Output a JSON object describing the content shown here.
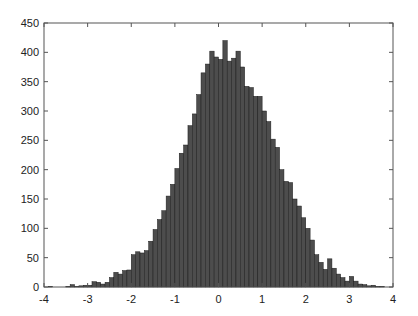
{
  "chart_data": {
    "type": "bar",
    "title": "",
    "xlabel": "",
    "ylabel": "",
    "xlim": [
      -4,
      4
    ],
    "ylim": [
      0,
      450
    ],
    "grid": false,
    "legend": null,
    "bin_width": 0.1,
    "bin_start": -4.0,
    "x_ticks": [
      -4,
      -3,
      -2,
      -1,
      0,
      1,
      2,
      3,
      4
    ],
    "y_ticks": [
      0,
      50,
      100,
      150,
      200,
      250,
      300,
      350,
      400,
      450
    ],
    "x_tick_labels": [
      "-4",
      "-3",
      "-2",
      "-1",
      "0",
      "1",
      "2",
      "3",
      "4"
    ],
    "y_tick_labels": [
      "0",
      "50",
      "100",
      "150",
      "200",
      "250",
      "300",
      "350",
      "400",
      "450"
    ],
    "categories": [
      "-4.0",
      "-3.9",
      "-3.8",
      "-3.7",
      "-3.6",
      "-3.5",
      "-3.4",
      "-3.3",
      "-3.2",
      "-3.1",
      "-3.0",
      "-2.9",
      "-2.8",
      "-2.7",
      "-2.6",
      "-2.5",
      "-2.4",
      "-2.3",
      "-2.2",
      "-2.1",
      "-2.0",
      "-1.9",
      "-1.8",
      "-1.7",
      "-1.6",
      "-1.5",
      "-1.4",
      "-1.3",
      "-1.2",
      "-1.1",
      "-1.0",
      "-0.9",
      "-0.8",
      "-0.7",
      "-0.6",
      "-0.5",
      "-0.4",
      "-0.3",
      "-0.2",
      "-0.1",
      "0.0",
      "0.1",
      "0.2",
      "0.3",
      "0.4",
      "0.5",
      "0.6",
      "0.7",
      "0.8",
      "0.9",
      "1.0",
      "1.1",
      "1.2",
      "1.3",
      "1.4",
      "1.5",
      "1.6",
      "1.7",
      "1.8",
      "1.9",
      "2.0",
      "2.1",
      "2.2",
      "2.3",
      "2.4",
      "2.5",
      "2.6",
      "2.7",
      "2.8",
      "2.9",
      "3.0",
      "3.1",
      "3.2",
      "3.3",
      "3.4",
      "3.5",
      "3.6",
      "3.7",
      "3.8",
      "3.9"
    ],
    "values": [
      0,
      1,
      0,
      0,
      0,
      1,
      4,
      1,
      2,
      3,
      3,
      9,
      8,
      5,
      8,
      16,
      25,
      22,
      28,
      29,
      55,
      60,
      58,
      62,
      78,
      98,
      115,
      130,
      155,
      175,
      202,
      228,
      242,
      275,
      295,
      328,
      365,
      380,
      402,
      392,
      388,
      420,
      385,
      390,
      402,
      375,
      342,
      340,
      325,
      325,
      300,
      282,
      252,
      238,
      200,
      180,
      178,
      150,
      138,
      118,
      100,
      80,
      55,
      42,
      30,
      48,
      32,
      22,
      16,
      10,
      18,
      10,
      5,
      4,
      2,
      3,
      1,
      1,
      0,
      0
    ],
    "bar_color": "#4d4d4d",
    "bar_edge_color": "#1a1a1a",
    "axis_color": "#555555"
  }
}
